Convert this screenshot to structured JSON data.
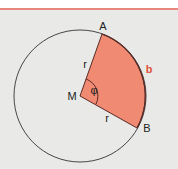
{
  "diagram": {
    "colors": {
      "background": "#e9eae7",
      "rule": "#e8877f",
      "sector_fill": "#f08a72",
      "sector_stroke": "#5a2a25",
      "circle_stroke": "#333333",
      "arc_label": "#e0513a"
    },
    "labels": {
      "point_a": "A",
      "point_b": "B",
      "center": "M",
      "radius_1": "r",
      "radius_2": "r",
      "angle": "φ",
      "arc": "b"
    }
  }
}
